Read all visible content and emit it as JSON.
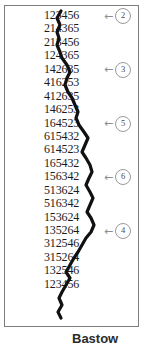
{
  "figure": {
    "title_fragment": "Bastow",
    "frame_color": "#7d7d7d",
    "wire_color": "#111111",
    "callout_color": "#9a9a9a",
    "text_color": "#1a1a1a",
    "rows": [
      {
        "word": "123456"
      },
      {
        "word": "214365"
      },
      {
        "word": "213456"
      },
      {
        "word": "124365"
      },
      {
        "word": "142635"
      },
      {
        "word": "416253"
      },
      {
        "word": "412635"
      },
      {
        "word": "146253"
      },
      {
        "word": "164523"
      },
      {
        "word": "615432"
      },
      {
        "word": "614523"
      },
      {
        "word": "165432"
      },
      {
        "word": "156342"
      },
      {
        "word": "513624"
      },
      {
        "word": "516342"
      },
      {
        "word": "153624"
      },
      {
        "word": "135264"
      },
      {
        "word": "312546"
      },
      {
        "word": "315264"
      },
      {
        "word": "132546"
      },
      {
        "word": "123456"
      }
    ],
    "callouts": [
      {
        "label": "2",
        "row": 0
      },
      {
        "label": "3",
        "row": 4
      },
      {
        "label": "5",
        "row": 8
      },
      {
        "label": "6",
        "row": 12
      },
      {
        "label": "4",
        "row": 16
      }
    ],
    "wire_points": "61,11 57,18 60,25 57,32 59,38 57,45 60,52 62,58 67,65 70,72 67,78 65,85 68,92 72,98 75,105 78,112 76,118 79,125 84,132 88,138 85,145 82,152 86,158 90,165 92,172 89,178 86,185 90,192 93,198 90,205 87,212 91,218 94,225 91,232 86,238 82,245 78,252 74,258 70,265 66,272 70,278 66,285 62,292 59,298 62,305 58,312 61,318"
  }
}
